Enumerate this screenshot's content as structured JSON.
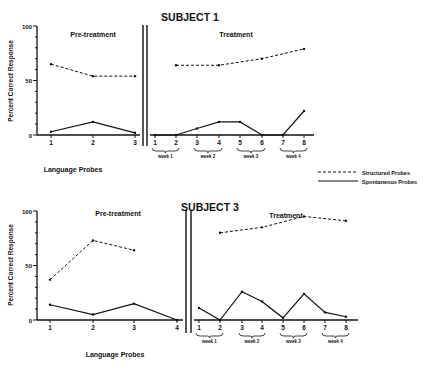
{
  "legend": {
    "structured_label": "Structured Probes",
    "spontaneous_label": "Spontaneous Probes"
  },
  "chart_data": [
    {
      "type": "line",
      "title": "SUBJECT 1",
      "ylabel": "Percent Correct Response",
      "xlabel": "Language Probes",
      "ylim": [
        0,
        100
      ],
      "y_ticks": [
        "0",
        "50",
        "100"
      ],
      "phases": [
        {
          "label": "Pre-treatment",
          "x": [
            "1",
            "2",
            "3"
          ],
          "series": [
            {
              "name": "Structured Probes",
              "style": "dashed",
              "values": [
                65,
                54,
                54
              ]
            },
            {
              "name": "Spontaneous Probes",
              "style": "solid",
              "values": [
                3,
                12,
                2
              ]
            }
          ]
        },
        {
          "label": "Treatment",
          "x": [
            "1",
            "2",
            "3",
            "4",
            "5",
            "6",
            "7",
            "8"
          ],
          "week_labels": [
            "week 1",
            "week 2",
            "week 3",
            "week 4"
          ],
          "series": [
            {
              "name": "Structured Probes",
              "style": "dashed",
              "x_points": [
                "2",
                "4",
                "6",
                "8"
              ],
              "values": [
                64,
                64,
                70,
                79
              ]
            },
            {
              "name": "Spontaneous Probes",
              "style": "solid",
              "values": [
                0,
                0,
                6,
                12,
                12,
                0,
                0,
                22
              ]
            }
          ]
        }
      ]
    },
    {
      "type": "line",
      "title": "SUBJECT 3",
      "ylabel": "Percent Correct Response",
      "xlabel": "Language Probes",
      "ylim": [
        0,
        100
      ],
      "y_ticks": [
        "0",
        "50",
        "100"
      ],
      "phases": [
        {
          "label": "Pre-treatment",
          "x": [
            "1",
            "2",
            "3",
            "4"
          ],
          "series": [
            {
              "name": "Structured Probes",
              "style": "dashed",
              "x_points": [
                "1",
                "2",
                "3"
              ],
              "values": [
                37,
                73,
                64
              ]
            },
            {
              "name": "Spontaneous Probes",
              "style": "solid",
              "values": [
                14,
                5,
                15,
                0
              ]
            }
          ]
        },
        {
          "label": "Treatment",
          "x": [
            "1",
            "2",
            "3",
            "4",
            "5",
            "6",
            "7",
            "8"
          ],
          "week_labels": [
            "week 1",
            "week 2",
            "week 3",
            "week 4"
          ],
          "series": [
            {
              "name": "Structured Probes",
              "style": "dashed",
              "x_points": [
                "2",
                "4",
                "6",
                "8"
              ],
              "values": [
                80,
                85,
                95,
                91
              ]
            },
            {
              "name": "Spontaneous Probes",
              "style": "solid",
              "values": [
                11,
                0,
                26,
                17,
                2,
                24,
                7,
                3
              ]
            }
          ]
        }
      ]
    }
  ]
}
